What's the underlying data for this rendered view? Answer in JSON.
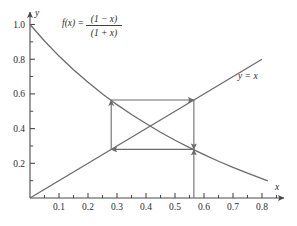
{
  "chart_data": {
    "type": "line",
    "title": "",
    "xlabel": "x",
    "ylabel": "y",
    "xlim": [
      0,
      0.86
    ],
    "ylim": [
      0,
      1.06
    ],
    "grid": false,
    "legend_position": "inline-annotations",
    "xticks": [
      0.1,
      0.2,
      0.3,
      0.4,
      0.5,
      0.6,
      0.7,
      0.8
    ],
    "xtick_labels": [
      "0.1",
      "0.2",
      "0.3",
      "0.4",
      "0.5",
      "0.6",
      "0.7",
      "0.8"
    ],
    "xminor_ticks": [
      0.05,
      0.15,
      0.25,
      0.35,
      0.45,
      0.55,
      0.65,
      0.75,
      0.85
    ],
    "yticks": [
      0.2,
      0.4,
      0.6,
      0.8,
      1.0
    ],
    "ytick_labels": [
      "0.2",
      "0.4",
      "0.6",
      "0.8",
      "1.0"
    ],
    "yminor_ticks": [
      0.1,
      0.3,
      0.5,
      0.7,
      0.9
    ],
    "series": [
      {
        "name": "f(x) = (1 - x)/(1 + x)",
        "label_text": "f(x) =",
        "label_numerator": "(1 − x)",
        "label_denominator": "(1 + x)",
        "type": "curve",
        "formula": "(1-x)/(1+x)",
        "x_start": 0.0,
        "x_end": 0.82,
        "points": [
          [
            0.0,
            1.0
          ],
          [
            0.05,
            0.905
          ],
          [
            0.1,
            0.818
          ],
          [
            0.15,
            0.739
          ],
          [
            0.2,
            0.667
          ],
          [
            0.25,
            0.6
          ],
          [
            0.3,
            0.538
          ],
          [
            0.35,
            0.481
          ],
          [
            0.4,
            0.429
          ],
          [
            0.45,
            0.379
          ],
          [
            0.5,
            0.333
          ],
          [
            0.55,
            0.29
          ],
          [
            0.6,
            0.25
          ],
          [
            0.65,
            0.212
          ],
          [
            0.7,
            0.176
          ],
          [
            0.75,
            0.143
          ],
          [
            0.82,
            0.099
          ]
        ]
      },
      {
        "name": "y = x",
        "label_text": "y = x",
        "type": "line",
        "formula": "x",
        "x_start": 0.0,
        "x_end": 0.8,
        "points": [
          [
            0.0,
            0.0
          ],
          [
            0.8,
            0.8
          ]
        ]
      }
    ],
    "annotations": {
      "cobweb": {
        "description": "Cobweb iteration of f(x) = (1-x)/(1+x) spiraling toward the fixed point",
        "fixed_point": 0.414,
        "x_left": 0.28,
        "x_right": 0.565,
        "y_low": 0.28,
        "y_high": 0.565,
        "segments": [
          {
            "from": [
              0.565,
              0.0
            ],
            "to": [
              0.565,
              0.28
            ],
            "arrow": "up"
          },
          {
            "from": [
              0.565,
              0.28
            ],
            "to": [
              0.28,
              0.28
            ],
            "arrow": "left"
          },
          {
            "from": [
              0.28,
              0.28
            ],
            "to": [
              0.28,
              0.565
            ],
            "arrow": "up"
          },
          {
            "from": [
              0.28,
              0.565
            ],
            "to": [
              0.565,
              0.565
            ],
            "arrow": "right"
          },
          {
            "from": [
              0.565,
              0.565
            ],
            "to": [
              0.565,
              0.28
            ],
            "arrow": "down"
          }
        ]
      }
    },
    "axis_arrow_x": true,
    "axis_arrow_y": true
  },
  "style": {
    "line_color": "#6b6b6b",
    "axis_color": "#4a4a4a",
    "text_color": "#2b2b2b",
    "background": "#ffffff"
  }
}
